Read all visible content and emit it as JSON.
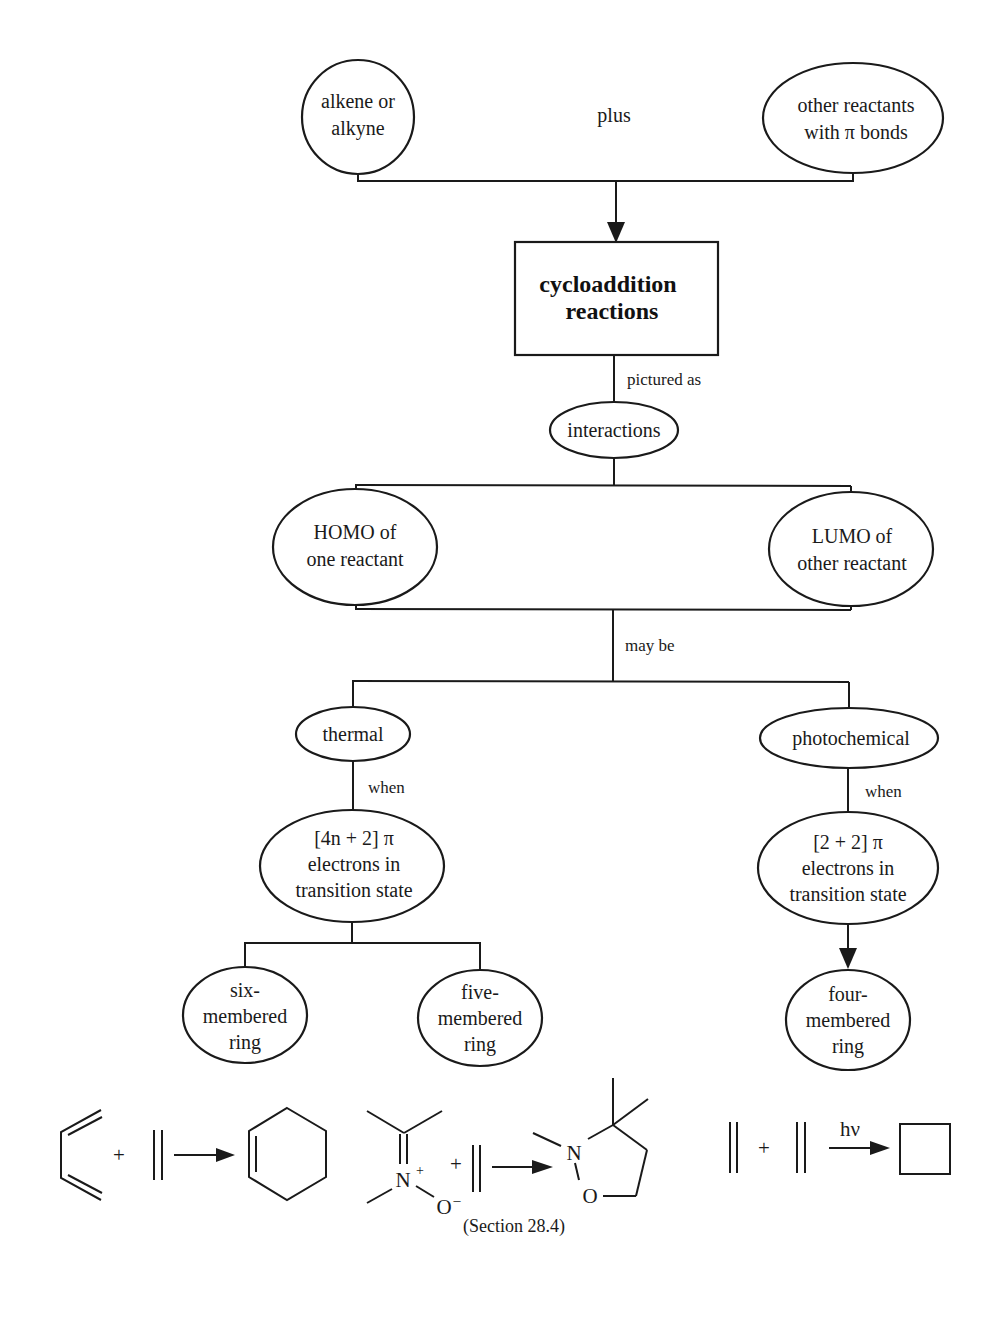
{
  "diagram": {
    "type": "concept-map",
    "nodes": {
      "alkene": {
        "lines": [
          "alkene or",
          "alkyne"
        ]
      },
      "plus_label": "plus",
      "other_reactants": {
        "lines": [
          "other reactants",
          "with π bonds"
        ]
      },
      "cycloaddition": {
        "lines": [
          "cycloaddition",
          "reactions"
        ]
      },
      "pictured_as": "pictured as",
      "interactions": {
        "lines": [
          "interactions"
        ]
      },
      "homo": {
        "lines": [
          "HOMO of",
          "one reactant"
        ]
      },
      "lumo": {
        "lines": [
          "LUMO of",
          "other reactant"
        ]
      },
      "may_be": "may be",
      "thermal": {
        "lines": [
          "thermal"
        ]
      },
      "photochemical": {
        "lines": [
          "photochemical"
        ]
      },
      "when_left": "when",
      "when_right": "when",
      "four_n_plus_two": {
        "lines": [
          "[4n + 2]  π",
          "electrons in",
          "transition state"
        ]
      },
      "two_plus_two": {
        "lines": [
          "[2 + 2]  π",
          "electrons in",
          "transition state"
        ]
      },
      "six_ring": {
        "lines": [
          "six-",
          "membered",
          "ring"
        ]
      },
      "five_ring": {
        "lines": [
          "five-",
          "membered",
          "ring"
        ]
      },
      "four_ring": {
        "lines": [
          "four-",
          "membered",
          "ring"
        ]
      }
    },
    "reactions": {
      "diels_alder": {
        "plus": "+"
      },
      "dipolar": {
        "plus": "+",
        "n_label": "N",
        "n_charge": "+",
        "o_label": "O",
        "o_charge": "–",
        "product_n": "N",
        "product_o": "O"
      },
      "photochemical": {
        "plus": "+",
        "condition": "hν"
      }
    },
    "caption": "(Section 28.4)"
  }
}
